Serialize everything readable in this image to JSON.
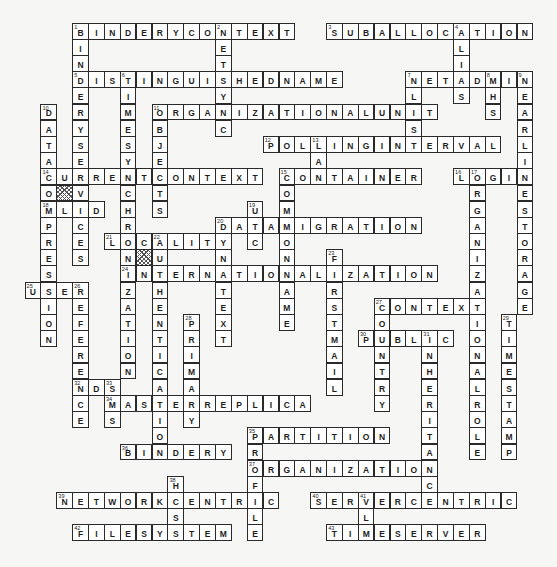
{
  "puzzle": {
    "type": "crossword",
    "grid": {
      "origin_x": 25,
      "origin_y": 23,
      "pitch_x": 15.87,
      "pitch_y": 16.19
    },
    "blocked_cells": [
      {
        "row": 10,
        "col": 2
      },
      {
        "row": 14,
        "col": 7
      }
    ],
    "across": [
      {
        "number": 1,
        "answer": "BINDERYCONTEXT",
        "row": 0,
        "col": 3
      },
      {
        "number": 3,
        "answer": "SUBALLOCATION",
        "row": 0,
        "col": 19
      },
      {
        "number": 5,
        "answer": "DISTINGUISHEDNAME",
        "row": 3,
        "col": 3
      },
      {
        "number": 7,
        "answer": "NETADMIN",
        "row": 3,
        "col": 24
      },
      {
        "number": 11,
        "answer": "ORGANIZATIONALUNIT",
        "row": 5,
        "col": 8
      },
      {
        "number": 12,
        "answer": "POLLINGINTERVAL",
        "row": 7,
        "col": 15
      },
      {
        "number": 14,
        "answer": "CURRENTCONTEXT",
        "row": 9,
        "col": 1
      },
      {
        "number": 15,
        "answer": "CONTAINER",
        "row": 9,
        "col": 16
      },
      {
        "number": 16,
        "answer": "LOGIN",
        "row": 9,
        "col": 27
      },
      {
        "number": 18,
        "answer": "MLID",
        "row": 11,
        "col": 1
      },
      {
        "number": 20,
        "answer": "DATAMIGRATION",
        "row": 12,
        "col": 12
      },
      {
        "number": 21,
        "answer": "LOCALITY",
        "row": 13,
        "col": 5
      },
      {
        "number": 24,
        "answer": "INTERNATIONALIZATION",
        "row": 15,
        "col": 6
      },
      {
        "number": 25,
        "answer": "USER",
        "row": 16,
        "col": 0
      },
      {
        "number": 27,
        "answer": "CONTEXT",
        "row": 17,
        "col": 22
      },
      {
        "number": 30,
        "answer": "PUBLIC",
        "row": 19,
        "col": 21
      },
      {
        "number": 32,
        "answer": "NDS",
        "row": 22,
        "col": 3
      },
      {
        "number": 34,
        "answer": "MASTERREPLICA",
        "row": 23,
        "col": 5
      },
      {
        "number": 35,
        "answer": "PARTITION",
        "row": 25,
        "col": 14
      },
      {
        "number": 36,
        "answer": "BINDERY",
        "row": 26,
        "col": 6
      },
      {
        "number": 37,
        "answer": "ORGANIZATION",
        "row": 27,
        "col": 14
      },
      {
        "number": 39,
        "answer": "NETWORKCENTRIC",
        "row": 29,
        "col": 2
      },
      {
        "number": 40,
        "answer": "SERVERCENTRIC",
        "row": 29,
        "col": 18
      },
      {
        "number": 42,
        "answer": "FILESYSTEM",
        "row": 31,
        "col": 3
      },
      {
        "number": 43,
        "answer": "TIMESERVER",
        "row": 31,
        "col": 19
      }
    ],
    "down": [
      {
        "number": 1,
        "answer": "BINDERYSERVICES",
        "row": 0,
        "col": 3
      },
      {
        "number": 2,
        "answer": "NETSYNC",
        "row": 0,
        "col": 12
      },
      {
        "number": 4,
        "answer": "ALIAS",
        "row": 0,
        "col": 27
      },
      {
        "number": 6,
        "answer": "TIMESYNCHRONIZATION",
        "row": 3,
        "col": 6
      },
      {
        "number": 7,
        "answer": "NLIST",
        "row": 3,
        "col": 24
      },
      {
        "number": 8,
        "answer": "MHS",
        "row": 3,
        "col": 29
      },
      {
        "number": 9,
        "answer": "NEARLINESTORAGE",
        "row": 3,
        "col": 31
      },
      {
        "number": 10,
        "answer": "DATACOMPRESSION",
        "row": 5,
        "col": 1
      },
      {
        "number": 11,
        "answer": "OBJECTS",
        "row": 5,
        "col": 8
      },
      {
        "number": 13,
        "answer": "LAN",
        "row": 7,
        "col": 18
      },
      {
        "number": 15,
        "answer": "COMMONNAME",
        "row": 9,
        "col": 16
      },
      {
        "number": 17,
        "answer": "ORGANIZATIONALROLE",
        "row": 9,
        "col": 28
      },
      {
        "number": 19,
        "answer": "UTC",
        "row": 11,
        "col": 14
      },
      {
        "number": 20,
        "answer": "DYNATEXT",
        "row": 12,
        "col": 12
      },
      {
        "number": 22,
        "answer": "AUTHENTICATION",
        "row": 13,
        "col": 8
      },
      {
        "number": 23,
        "answer": "FIRSTMAIL",
        "row": 14,
        "col": 19
      },
      {
        "number": 26,
        "answer": "REFERENCE",
        "row": 16,
        "col": 3
      },
      {
        "number": 27,
        "answer": "COUNTRY",
        "row": 17,
        "col": 22
      },
      {
        "number": 28,
        "answer": "PRIMARY",
        "row": 18,
        "col": 10
      },
      {
        "number": 29,
        "answer": "TIMESTAMP",
        "row": 18,
        "col": 30
      },
      {
        "number": 31,
        "answer": "INHERITANCE",
        "row": 19,
        "col": 25
      },
      {
        "number": 33,
        "answer": "SMS",
        "row": 22,
        "col": 5
      },
      {
        "number": 35,
        "answer": "PROFILE",
        "row": 25,
        "col": 14
      },
      {
        "number": 38,
        "answer": "HCSS",
        "row": 28,
        "col": 9
      },
      {
        "number": 41,
        "answer": "VLM",
        "row": 29,
        "col": 21
      }
    ]
  }
}
